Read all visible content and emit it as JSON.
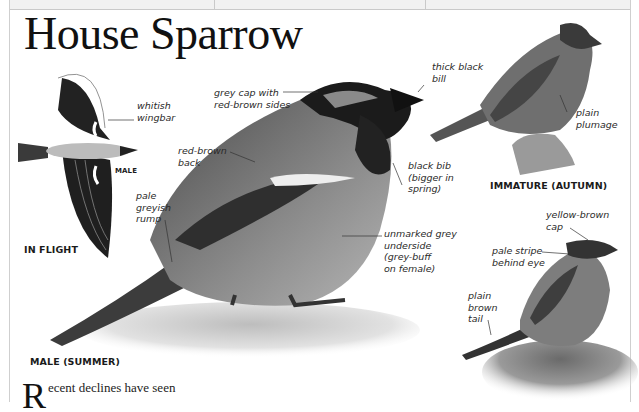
{
  "page": {
    "title": "House Sparrow",
    "body_text_dropcap": "R",
    "body_text": "ecent declines have seen"
  },
  "figures": [
    {
      "caption": "IN FLIGHT",
      "sublabel": "MALE",
      "annotations": [
        "whitish\nwingbar",
        "pale\ngreyish\nrump"
      ]
    },
    {
      "caption": "MALE (SUMMER)",
      "annotations": [
        "grey cap with\nred-brown sides",
        "thick black\nbill",
        "red-brown\nback",
        "black bib\n(bigger in\nspring)",
        "unmarked grey\nunderside\n(grey-buff\non female)"
      ]
    },
    {
      "caption": "IMMATURE (AUTUMN)",
      "annotations": [
        "plain\nplumage"
      ]
    },
    {
      "caption": "",
      "annotations": [
        "yellow-brown\ncap",
        "pale stripe\nbehind eye",
        "plain\nbrown\ntail"
      ]
    }
  ]
}
